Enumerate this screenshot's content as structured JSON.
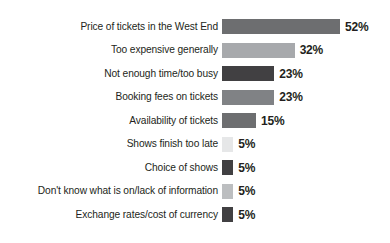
{
  "chart_data": {
    "type": "bar",
    "orientation": "horizontal",
    "title": "",
    "subtitle": "",
    "xlabel": "",
    "ylabel": "",
    "xlim": [
      0,
      52
    ],
    "grid": false,
    "legend": "none",
    "value_suffix": "%",
    "categories": [
      "Price of tickets in the West End",
      "Too expensive generally",
      "Not enough time/too busy",
      "Booking fees on tickets",
      "Availability of tickets",
      "Shows finish too late",
      "Choice of shows",
      "Don't know what is on/lack of information",
      "Exchange rates/cost of currency"
    ],
    "values": [
      52,
      32,
      23,
      23,
      15,
      5,
      5,
      5,
      5
    ],
    "value_labels": [
      "52%",
      "32%",
      "23%",
      "23%",
      "15%",
      "5%",
      "5%",
      "5%",
      "5%"
    ],
    "bar_colors": [
      "#6d6e70",
      "#a7a9ac",
      "#414042",
      "#808285",
      "#6d6e70",
      "#e6e7e8",
      "#414042",
      "#bcbec0",
      "#414042"
    ]
  },
  "layout": {
    "bar_origin_x": 222,
    "bar_height": 15,
    "row_pitch": 23.5,
    "first_row_top": 19,
    "pixels_per_unit": 2.27
  }
}
